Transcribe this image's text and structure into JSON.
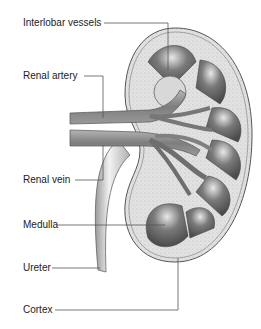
{
  "diagram": {
    "labels": [
      {
        "id": "interlobar-vessels",
        "text": "Interlobar vessels"
      },
      {
        "id": "renal-artery",
        "text": "Renal artery"
      },
      {
        "id": "renal-vein",
        "text": "Renal vein"
      },
      {
        "id": "medulla",
        "text": "Medulla"
      },
      {
        "id": "ureter",
        "text": "Ureter"
      },
      {
        "id": "cortex",
        "text": "Cortex"
      }
    ]
  },
  "colors": {
    "cortex_fill": "#dcdcdc",
    "medulla_fill": "#6e6e6e",
    "vessel_fill": "#8a8a8a",
    "outline": "#555555",
    "leader_line": "#555555"
  }
}
